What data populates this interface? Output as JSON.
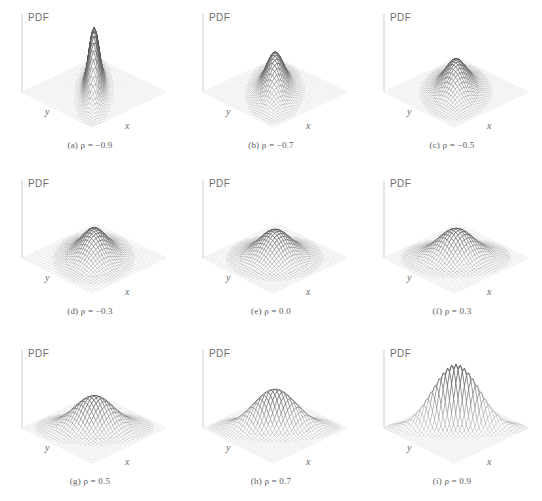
{
  "figure": {
    "title": "",
    "rows": 3,
    "cols": 3,
    "vertical_axis_label": "PDF",
    "x_axis_label": "x",
    "y_axis_label": "y"
  },
  "panels": [
    {
      "id": "a",
      "caption": "(a)  ρ = −0.9",
      "rho": -0.9,
      "rho_text": "−0.9",
      "label": "(a)"
    },
    {
      "id": "b",
      "caption": "(b)  ρ = −0.7",
      "rho": -0.7,
      "rho_text": "−0.7",
      "label": "(b)"
    },
    {
      "id": "c",
      "caption": "(c)  ρ = −0.5",
      "rho": -0.5,
      "rho_text": "−0.5",
      "label": "(c)"
    },
    {
      "id": "d",
      "caption": "(d)  ρ = −0.3",
      "rho": -0.3,
      "rho_text": "−0.3",
      "label": "(d)"
    },
    {
      "id": "e",
      "caption": "(e)  ρ = 0.0",
      "rho": 0.0,
      "rho_text": "0.0",
      "label": "(e)"
    },
    {
      "id": "f",
      "caption": "(f)  ρ = 0.3",
      "rho": 0.3,
      "rho_text": "0.3",
      "label": "(f)"
    },
    {
      "id": "g",
      "caption": "(g)  ρ = 0.5",
      "rho": 0.5,
      "rho_text": "0.5",
      "label": "(g)"
    },
    {
      "id": "h",
      "caption": "(h)  ρ = 0.7",
      "rho": 0.7,
      "rho_text": "0.7",
      "label": "(h)"
    },
    {
      "id": "i",
      "caption": "(i)  ρ = 0.9",
      "rho": 0.9,
      "rho_text": "0.9",
      "label": "(i)"
    }
  ],
  "colors": {
    "background": "#ffffff",
    "ground_mesh": "#d2d2d2",
    "surface_mesh": "#8e8e8e",
    "surface_fill": "#ffffff",
    "contour": "#4a4a4a",
    "axis_line": "#cfcfcf",
    "text": "#606060"
  },
  "chart_data": {
    "type": "surface",
    "xlabel": "x",
    "ylabel": "y",
    "zlabel": "PDF",
    "grid": true,
    "legend": "none",
    "distribution": "bivariate normal",
    "parameters": {
      "mean_x": 0,
      "mean_y": 0,
      "sigma_x": 1,
      "sigma_y": 1
    },
    "xlim": [
      -3,
      3
    ],
    "ylim": [
      -3,
      3
    ],
    "zlim": [
      0,
      0.4
    ],
    "series": [
      {
        "name": "(a) ρ = −0.9",
        "rho": -0.9,
        "peak_density": 0.365,
        "contour_orientation_deg": 135,
        "contour_elongation": 4.36
      },
      {
        "name": "(b) ρ = −0.7",
        "rho": -0.7,
        "peak_density": 0.223,
        "contour_orientation_deg": 135,
        "contour_elongation": 2.38
      },
      {
        "name": "(c) ρ = −0.5",
        "rho": -0.5,
        "peak_density": 0.184,
        "contour_orientation_deg": 135,
        "contour_elongation": 1.73
      },
      {
        "name": "(d) ρ = −0.3",
        "rho": -0.3,
        "peak_density": 0.167,
        "contour_orientation_deg": 135,
        "contour_elongation": 1.36
      },
      {
        "name": "(e) ρ = 0.0",
        "rho": 0.0,
        "peak_density": 0.159,
        "contour_orientation_deg": 0,
        "contour_elongation": 1.0
      },
      {
        "name": "(f) ρ = 0.3",
        "rho": 0.3,
        "peak_density": 0.167,
        "contour_orientation_deg": 45,
        "contour_elongation": 1.36
      },
      {
        "name": "(g) ρ = 0.5",
        "rho": 0.5,
        "peak_density": 0.184,
        "contour_orientation_deg": 45,
        "contour_elongation": 1.73
      },
      {
        "name": "(h) ρ = 0.7",
        "rho": 0.7,
        "peak_density": 0.223,
        "contour_orientation_deg": 45,
        "contour_elongation": 2.38
      },
      {
        "name": "(i) ρ = 0.9",
        "rho": 0.9,
        "peak_density": 0.365,
        "contour_orientation_deg": 45,
        "contour_elongation": 4.36
      }
    ],
    "contour_levels": [
      0.02,
      0.05,
      0.09,
      0.13
    ]
  }
}
